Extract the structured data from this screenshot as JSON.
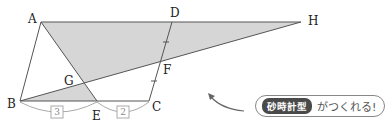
{
  "diagram": {
    "points": {
      "A": {
        "label": "A",
        "x": 41,
        "y": 22
      },
      "B": {
        "label": "B",
        "x": 20,
        "y": 101
      },
      "C": {
        "label": "C",
        "x": 149,
        "y": 101
      },
      "D": {
        "label": "D",
        "x": 172,
        "y": 22
      },
      "E": {
        "label": "E",
        "x": 97,
        "y": 101
      },
      "F": {
        "label": "F",
        "x": 160,
        "y": 61
      },
      "G": {
        "label": "G",
        "x": 84,
        "y": 83
      },
      "H": {
        "label": "H",
        "x": 301,
        "y": 22
      }
    },
    "segment_ratios": {
      "BE": "3",
      "EC": "2"
    },
    "colors": {
      "line": "#555555",
      "shade": "#d6d6d6",
      "bracket": "#aaaaaa"
    }
  },
  "callout": {
    "badge": "砂時計型",
    "text": "がつくれる!"
  }
}
